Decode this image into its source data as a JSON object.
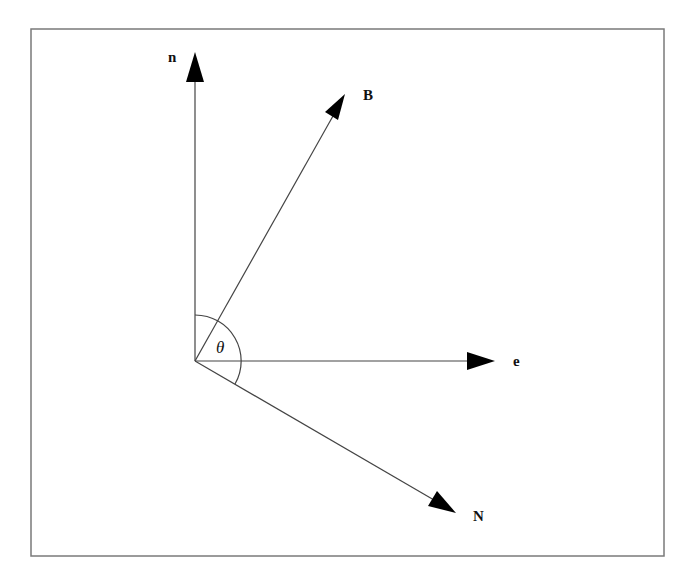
{
  "diagram": {
    "title": "",
    "frame": {
      "x": 31,
      "y": 29,
      "width": 633,
      "height": 527,
      "stroke": "#7a7a7a"
    },
    "origin": {
      "x": 195,
      "y": 361
    },
    "vectors": [
      {
        "id": "n",
        "label": "n",
        "tip": {
          "x": 195,
          "y": 52
        },
        "label_pos": {
          "x": 168,
          "y": 62
        }
      },
      {
        "id": "B",
        "label": "B",
        "tip": {
          "x": 345,
          "y": 94
        },
        "label_pos": {
          "x": 363,
          "y": 100
        }
      },
      {
        "id": "e",
        "label": "e",
        "tip": {
          "x": 495,
          "y": 361
        },
        "label_pos": {
          "x": 513,
          "y": 366
        }
      },
      {
        "id": "N",
        "label": "N",
        "tip": {
          "x": 456,
          "y": 513
        },
        "label_pos": {
          "x": 473,
          "y": 520
        }
      }
    ],
    "angle": {
      "label": "θ",
      "label_pos": {
        "x": 217,
        "y": 352
      },
      "arc_radius": 46,
      "from": "n",
      "to": "N"
    },
    "colors": {
      "line": "#444444",
      "arrowhead": "#000000",
      "text": "#111111"
    }
  }
}
